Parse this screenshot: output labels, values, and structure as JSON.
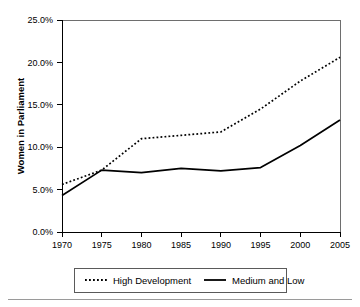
{
  "chart_data": {
    "type": "line",
    "title": "",
    "subtitle": "",
    "xlabel": "",
    "ylabel": "Women in Parliament",
    "x": [
      1970,
      1975,
      1980,
      1985,
      1990,
      1995,
      2000,
      2005
    ],
    "xtick_labels": [
      "1970",
      "1975",
      "1980",
      "1985",
      "1990",
      "1995",
      "2000",
      "2005"
    ],
    "ytick_labels": [
      "0.0%",
      "5.0%",
      "10.0%",
      "15.0%",
      "20.0%",
      "25.0%"
    ],
    "ytick_values": [
      0,
      5,
      10,
      15,
      20,
      25
    ],
    "xlim": [
      1970,
      2005
    ],
    "ylim": [
      0,
      25
    ],
    "grid": false,
    "legend_position": "bottom",
    "series": [
      {
        "name": "High Development",
        "style": "dotted",
        "color": "#000000",
        "values": [
          5.6,
          7.3,
          11.0,
          11.4,
          11.8,
          14.5,
          17.8,
          20.6
        ]
      },
      {
        "name": "Medium and Low",
        "style": "solid",
        "color": "#000000",
        "values": [
          4.3,
          7.3,
          7.0,
          7.5,
          7.2,
          7.6,
          10.2,
          13.2
        ]
      }
    ]
  },
  "legend": {
    "items": [
      {
        "label": "High Development",
        "style": "dotted"
      },
      {
        "label": "Medium and Low",
        "style": "solid"
      }
    ]
  },
  "axes": {
    "y_title": "Women in Parliament"
  }
}
